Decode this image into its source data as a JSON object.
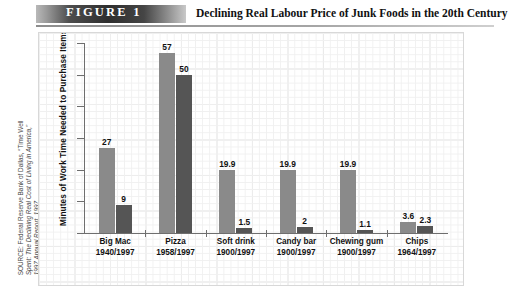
{
  "figure": {
    "badge_label": "FIGURE  1",
    "title": "Declining Real Labour Price of Junk Foods in the 20th Century"
  },
  "source": {
    "line1": "SOURCE: Federal Reserve Bank of Dallas, “Time Well",
    "line2": "Spent: The Declining Real Cost of Living in America,”",
    "line3": "1997 Annual Report, 1997."
  },
  "chart_data": {
    "type": "bar",
    "title": "Declining Real Labour Price of Junk Foods in the 20th Century",
    "xlabel": "",
    "ylabel": "Minutes of Work Time Needed to Purchase Items",
    "ylim": [
      0,
      60
    ],
    "yticks": [
      0,
      10,
      20,
      30,
      40,
      50,
      60
    ],
    "ytick_labels": [
      "0",
      "10",
      "20",
      "30",
      "40",
      "50",
      "60"
    ],
    "grid": true,
    "legend": "none",
    "categories": [
      "Big Mac",
      "Pizza",
      "Soft drink",
      "Candy bar",
      "Chewing gum",
      "Chips"
    ],
    "category_years": [
      "1940/1997",
      "1958/1997",
      "1900/1997",
      "1900/1997",
      "1900/1997",
      "1964/1997"
    ],
    "series": [
      {
        "name": "Earlier year",
        "color": "#8a8a8a",
        "values": [
          27,
          57,
          19.9,
          19.9,
          19.9,
          3.6
        ],
        "value_labels": [
          "27",
          "57",
          "19.9",
          "19.9",
          "19.9",
          "3.6"
        ]
      },
      {
        "name": "1997",
        "color": "#555555",
        "values": [
          9,
          50,
          1.5,
          2,
          1.1,
          2.3
        ],
        "value_labels": [
          "9",
          "50",
          "1.5",
          "2",
          "1.1",
          "2.3"
        ]
      }
    ]
  }
}
